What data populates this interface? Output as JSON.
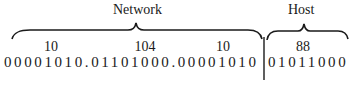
{
  "diagram": {
    "type": "ip-address-network-host-split",
    "network_label": "Network",
    "host_label": "Host",
    "decimal_octets": {
      "network": [
        "10",
        "104",
        "10"
      ],
      "host": [
        "88"
      ]
    },
    "binary": {
      "network": "00001010.01101000.00001010",
      "host": "01011000"
    },
    "colors": {
      "ink": "#1a1a1a",
      "background": "#ffffff"
    }
  }
}
